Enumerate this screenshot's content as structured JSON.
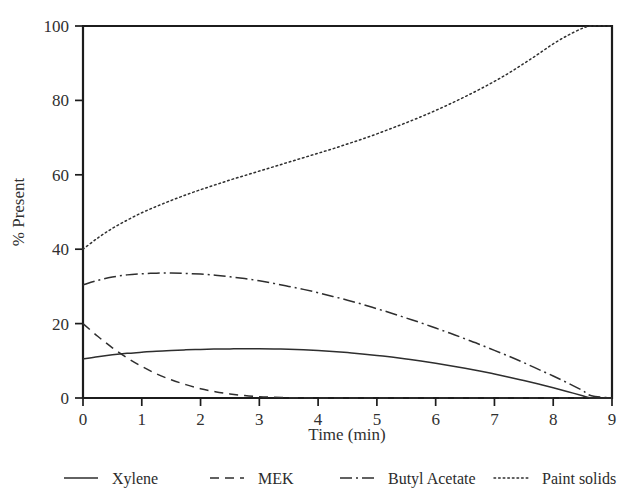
{
  "chart_data": {
    "type": "line",
    "title": "",
    "xlabel": "Time (min)",
    "ylabel": "% Present",
    "xlim": [
      0,
      9
    ],
    "ylim": [
      0,
      100
    ],
    "xticks": [
      "0",
      "1",
      "2",
      "3",
      "4",
      "5",
      "6",
      "7",
      "8",
      "9"
    ],
    "yticks": [
      "0",
      "20",
      "40",
      "60",
      "80",
      "100"
    ],
    "grid": false,
    "legend_position": "below",
    "x": [
      0,
      0.25,
      0.5,
      0.75,
      1,
      1.25,
      1.5,
      1.75,
      2,
      2.25,
      2.5,
      2.75,
      3,
      3.25,
      3.5,
      3.75,
      4,
      4.25,
      4.5,
      4.75,
      5,
      5.25,
      5.5,
      5.75,
      6,
      6.25,
      6.5,
      6.75,
      7,
      7.25,
      7.5,
      7.75,
      8,
      8.25,
      8.5,
      8.65,
      9
    ],
    "series": [
      {
        "name": "Xylene",
        "style": "solid",
        "color": "#2e2e2e",
        "values": [
          10.5,
          11.1,
          11.6,
          12.0,
          12.3,
          12.6,
          12.8,
          12.95,
          13.05,
          13.15,
          13.2,
          13.25,
          13.25,
          13.2,
          13.1,
          12.95,
          12.75,
          12.5,
          12.2,
          11.85,
          11.45,
          11.0,
          10.5,
          9.95,
          9.35,
          8.7,
          8.0,
          7.25,
          6.45,
          5.6,
          4.7,
          3.75,
          2.75,
          1.7,
          0.6,
          0.0,
          0.0
        ]
      },
      {
        "name": "MEK",
        "style": "dashed",
        "color": "#2e2e2e",
        "values": [
          20.0,
          16.6,
          13.5,
          10.8,
          8.5,
          6.5,
          4.9,
          3.6,
          2.5,
          1.7,
          1.1,
          0.65,
          0.35,
          0.2,
          0.1,
          0.05,
          0.0,
          0.0,
          0.0,
          0.0,
          0.0,
          0.0,
          0.0,
          0.0,
          0.0,
          0.0,
          0.0,
          0.0,
          0.0,
          0.0,
          0.0,
          0.0,
          0.0,
          0.0,
          0.0,
          0.0,
          0.0
        ]
      },
      {
        "name": "Butyl Acetate",
        "style": "dashdot",
        "color": "#2e2e2e",
        "values": [
          30.4,
          31.6,
          32.5,
          33.1,
          33.4,
          33.55,
          33.6,
          33.5,
          33.3,
          33.0,
          32.6,
          32.1,
          31.5,
          30.8,
          30.0,
          29.2,
          28.3,
          27.3,
          26.3,
          25.2,
          24.0,
          22.8,
          21.5,
          20.2,
          18.8,
          17.4,
          15.9,
          14.4,
          12.8,
          11.2,
          9.5,
          7.7,
          5.9,
          4.0,
          2.0,
          0.6,
          0.0
        ]
      },
      {
        "name": "Paint solids",
        "style": "dotted",
        "color": "#3a3a3a",
        "values": [
          40.0,
          43.0,
          45.6,
          47.8,
          49.8,
          51.5,
          53.1,
          54.6,
          56.0,
          57.3,
          58.6,
          59.8,
          61.0,
          62.2,
          63.4,
          64.6,
          65.8,
          67.0,
          68.3,
          69.6,
          71.0,
          72.5,
          74.0,
          75.6,
          77.3,
          79.1,
          81.0,
          83.0,
          85.1,
          87.4,
          89.9,
          92.5,
          95.2,
          97.5,
          99.4,
          100.0,
          100.0
        ]
      }
    ]
  },
  "legend": {
    "items": [
      {
        "label": "Xylene",
        "style": "solid"
      },
      {
        "label": "MEK",
        "style": "dashed"
      },
      {
        "label": "Butyl Acetate",
        "style": "dashdot"
      },
      {
        "label": "Paint solids",
        "style": "dotted"
      }
    ]
  }
}
